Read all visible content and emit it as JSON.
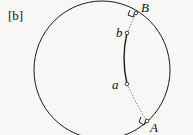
{
  "panel_label": "[b]",
  "points": {
    "B": "B",
    "b": "b",
    "a": "a",
    "A": "A"
  },
  "colors": {
    "stroke": "#1a1a1a",
    "background": "#f7f7f5"
  }
}
